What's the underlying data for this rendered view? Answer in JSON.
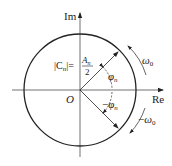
{
  "diagram": {
    "axes": {
      "x_label": "Re",
      "y_label": "Im",
      "origin_label": "O"
    },
    "magnitude_label": {
      "lhs": "|C",
      "lhs_sub": "n",
      "lhs_close": "|=",
      "numerator": "A",
      "numerator_sub": "n",
      "denominator": "2"
    },
    "angles": {
      "upper": "φ",
      "upper_sub": "n",
      "lower_prefix": "−",
      "lower": "φ",
      "lower_sub": "n"
    },
    "rotations": {
      "upper": "ω",
      "upper_sub": "0",
      "lower_prefix": "−",
      "lower": "ω",
      "lower_sub": "0"
    },
    "colors": {
      "stroke": "#222222",
      "background": "#ffffff"
    }
  }
}
